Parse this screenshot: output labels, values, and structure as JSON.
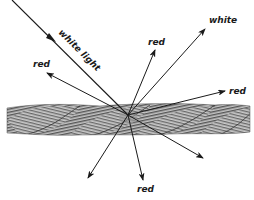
{
  "diagram": {
    "colors": {
      "ink": "#1a1a1a",
      "rope_dark": "#5a5a5a",
      "rope_light": "#bdbdbd",
      "background": "#ffffff"
    },
    "convergence_point": {
      "x": 128,
      "y": 115
    },
    "incident_ray": {
      "label": "white light",
      "from": {
        "x": 12,
        "y": 0
      },
      "to": {
        "x": 128,
        "y": 115
      }
    },
    "rays": [
      {
        "id": "red-upper-left",
        "label": "red",
        "tip": {
          "x": 47,
          "y": 73
        },
        "label_pos": {
          "x": 33,
          "y": 67
        }
      },
      {
        "id": "red-upper-center",
        "label": "red",
        "tip": {
          "x": 155,
          "y": 50
        },
        "label_pos": {
          "x": 148,
          "y": 45
        }
      },
      {
        "id": "white-upper-right",
        "label": "white",
        "tip": {
          "x": 205,
          "y": 29
        },
        "label_pos": {
          "x": 209,
          "y": 23
        }
      },
      {
        "id": "red-right",
        "label": "red",
        "tip": {
          "x": 225,
          "y": 91
        },
        "label_pos": {
          "x": 229,
          "y": 94
        }
      },
      {
        "id": "red-bottom",
        "label": "red",
        "tip": {
          "x": 143,
          "y": 180
        },
        "label_pos": {
          "x": 137,
          "y": 192
        }
      },
      {
        "id": "unlabeled-bottom-left",
        "label": "",
        "tip": {
          "x": 88,
          "y": 178
        }
      },
      {
        "id": "unlabeled-bottom-right",
        "label": "",
        "tip": {
          "x": 203,
          "y": 158
        }
      }
    ],
    "rope": {
      "x_start": 7,
      "x_end": 250,
      "y_top": 105,
      "y_bottom": 135,
      "twists": 4
    }
  }
}
